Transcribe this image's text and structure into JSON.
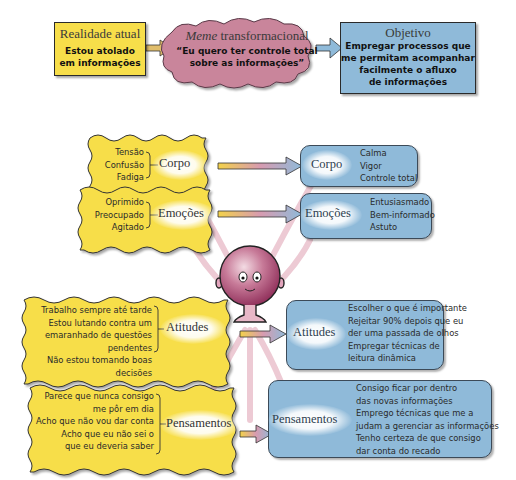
{
  "top_row": {
    "current_reality": {
      "title": "Realidade atual",
      "body_line1": "Estou atolado",
      "body_line2": "em informações"
    },
    "meme": {
      "title_italic": "Meme",
      "title_rest": " transformacional",
      "body_line1": "“Eu quero ter controle total",
      "body_line2": "sobre as informações”"
    },
    "objective": {
      "title": "Objetivo",
      "body_line1": "Empregar processos que",
      "body_line2": "me permitam acompanhar",
      "body_line3": "facilmente o afluxo",
      "body_line4": "de informações"
    }
  },
  "left_column": [
    {
      "category": "Corpo",
      "items": [
        "Tensão",
        "Confusão",
        "Fadiga"
      ]
    },
    {
      "category": "Emoções",
      "items": [
        "Oprimido",
        "Preocupado",
        "Agitado"
      ]
    },
    {
      "category": "Atitudes",
      "items": [
        "Trabalho sempre até tarde",
        "Estou lutando contra um",
        "emaranhado de questões pendentes",
        "Não estou tomando boas decisões"
      ]
    },
    {
      "category": "Pensamentos",
      "items": [
        "Parece que nunca consigo",
        "me pôr em dia",
        "Acho que não vou dar conta",
        "Acho que eu não sei o",
        "que eu deveria saber"
      ]
    }
  ],
  "right_column": [
    {
      "category": "Corpo",
      "items": [
        "Calma",
        "Vigor",
        "Controle total"
      ]
    },
    {
      "category": "Emoções",
      "items": [
        "Entusiasmado",
        "Bem-informado",
        "Astuto"
      ]
    },
    {
      "category": "Atitudes",
      "items": [
        "Escolher o que é importante",
        "Rejeitar 90% depois que eu",
        "der uma passada de olhos",
        "Empregar técnicas de",
        "leitura dinâmica"
      ]
    },
    {
      "category": "Pensamentos",
      "items": [
        "Consigo ficar por dentro",
        "das novas informações",
        "Emprego técnicas que me a",
        "judam a gerenciar as informações",
        "Tenho certeza de que consigo",
        "dar conta do recado"
      ]
    }
  ],
  "colors": {
    "yellow": "#f7de4a",
    "blue": "#8fbad9",
    "meme_pink": "#c9859b",
    "character": "#a8416a",
    "beam_pink": "#e7b9c6"
  }
}
